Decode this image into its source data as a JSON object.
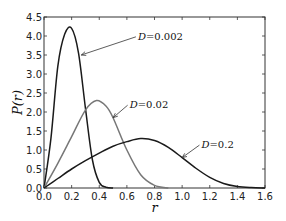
{
  "chart_data": {
    "type": "line",
    "title": "",
    "xlabel": "r",
    "ylabel": "P(r)",
    "xlim": [
      0.0,
      1.6
    ],
    "ylim": [
      0.0,
      4.5
    ],
    "xticks": [
      "0.0",
      "0.2",
      "0.4",
      "0.6",
      "0.8",
      "1.0",
      "1.2",
      "1.4",
      "1.6"
    ],
    "yticks": [
      "0.0",
      "0.5",
      "1.0",
      "1.5",
      "2.0",
      "2.5",
      "3.0",
      "3.5",
      "4.0",
      "4.5"
    ],
    "grid": false,
    "legend": "none",
    "series": [
      {
        "name": "D=0.002",
        "label": "D = 0.002",
        "color": "#1a1a1a",
        "peak_x": 0.2,
        "peak_y": 4.2,
        "x": [
          0.0,
          0.05,
          0.1,
          0.15,
          0.2,
          0.25,
          0.3,
          0.35,
          0.4,
          0.45,
          0.5
        ],
        "y": [
          0.0,
          1.3,
          3.2,
          4.05,
          4.2,
          3.55,
          2.1,
          0.75,
          0.15,
          0.02,
          0.0
        ]
      },
      {
        "name": "D=0.02",
        "label": "D = 0.02",
        "color": "#777777",
        "peak_x": 0.38,
        "peak_y": 2.3,
        "x": [
          0.0,
          0.1,
          0.2,
          0.3,
          0.38,
          0.45,
          0.5,
          0.6,
          0.7,
          0.8,
          0.9
        ],
        "y": [
          0.0,
          0.65,
          1.35,
          2.05,
          2.3,
          2.15,
          1.85,
          1.0,
          0.35,
          0.07,
          0.0
        ]
      },
      {
        "name": "D=0.2",
        "label": "D = 0.2",
        "color": "#1a1a1a",
        "peak_x": 0.7,
        "peak_y": 1.3,
        "x": [
          0.0,
          0.1,
          0.2,
          0.3,
          0.4,
          0.5,
          0.6,
          0.7,
          0.8,
          0.9,
          1.0,
          1.1,
          1.2,
          1.3,
          1.4,
          1.5,
          1.6
        ],
        "y": [
          0.0,
          0.25,
          0.5,
          0.72,
          0.92,
          1.1,
          1.22,
          1.3,
          1.25,
          1.07,
          0.8,
          0.52,
          0.28,
          0.12,
          0.04,
          0.01,
          0.0
        ]
      }
    ],
    "annotations": [
      {
        "text": "D = 0.002",
        "xy": [
          0.27,
          3.5
        ],
        "text_xy": [
          0.68,
          3.9
        ]
      },
      {
        "text": "D = 0.02",
        "xy": [
          0.5,
          1.85
        ],
        "text_xy": [
          0.62,
          2.1
        ]
      },
      {
        "text": "D = 0.2",
        "xy": [
          1.0,
          0.8
        ],
        "text_xy": [
          1.14,
          1.05
        ]
      }
    ]
  }
}
